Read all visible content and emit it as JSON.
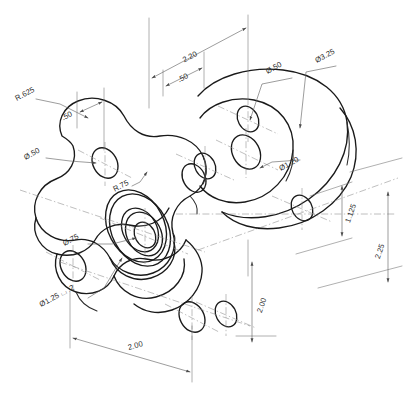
{
  "drawing": {
    "title": "Isometric Engineering Drawing — Four-Lobe Flange Plate with Mating Disc Flange",
    "background_color": "#ffffff",
    "line_color": "#1a1a1a",
    "dimension_color": "#5a5a5a",
    "center_line_color": "#8a8a8a",
    "projection": "isometric",
    "units": "inches",
    "part_description": "Four-lobed cloverleaf plate with central counterbored boss, mated to a round bolt-circle flange disc",
    "dimensions": [
      {
        "id": "dim-2-20",
        "label": "2.20",
        "type": "linear",
        "x": 191,
        "y": 59,
        "rotate": -28
      },
      {
        "id": "dim-50-top",
        "label": ".50",
        "type": "linear",
        "x": 182,
        "y": 82,
        "rotate": -28
      },
      {
        "id": "dim-diam-50-top",
        "label": "Ø.50",
        "type": "diameter",
        "x": 272,
        "y": 66,
        "rotate": -28
      },
      {
        "id": "dim-diam-3-25",
        "label": "Ø3.25",
        "type": "diameter",
        "x": 322,
        "y": 58,
        "rotate": -28
      },
      {
        "id": "dim-r-625",
        "label": "R.625",
        "type": "radius",
        "x": 22,
        "y": 100,
        "rotate": -28
      },
      {
        "id": "dim-50-left",
        "label": ".50",
        "type": "linear",
        "x": 66,
        "y": 117,
        "rotate": -28
      },
      {
        "id": "dim-diam-50-left",
        "label": "Ø.50",
        "type": "diameter",
        "x": 30,
        "y": 157,
        "rotate": -28
      },
      {
        "id": "dim-r-75",
        "label": "R.75",
        "type": "radius",
        "x": 120,
        "y": 185,
        "rotate": -28
      },
      {
        "id": "dim-diam-1-20",
        "label": "Ø1.20",
        "type": "diameter",
        "x": 283,
        "y": 166,
        "rotate": -28
      },
      {
        "id": "dim-diam-75",
        "label": "Ø.75",
        "type": "diameter",
        "x": 64,
        "y": 242,
        "rotate": -28
      },
      {
        "id": "dim-cbore",
        "label": "Ø1.25 ⌴ .2",
        "type": "counterbore",
        "x": 47,
        "y": 298,
        "rotate": -28
      },
      {
        "id": "dim-1-125",
        "label": "1.125",
        "type": "linear",
        "x": 363,
        "y": 216,
        "rotate": 62
      },
      {
        "id": "dim-2-25",
        "label": "2.25",
        "type": "linear",
        "x": 392,
        "y": 250,
        "rotate": 62
      },
      {
        "id": "dim-2-00-right",
        "label": "2.00",
        "type": "linear",
        "x": 263,
        "y": 307,
        "rotate": 62
      },
      {
        "id": "dim-2-00-bottom",
        "label": "2.00",
        "type": "linear",
        "x": 145,
        "y": 352,
        "rotate": -28
      }
    ],
    "features": [
      {
        "name": "four-lobe-plate",
        "note": "Cloverleaf plate body, 4 lobes with R.625 outer radii and R.75 fillets"
      },
      {
        "name": "center-counterbore",
        "note": "Central Ø.75 through hole with Ø1.25 counterbore, .2 deep"
      },
      {
        "name": "lobe-holes",
        "note": "Four Ø.50 holes, one at each lobe"
      },
      {
        "name": "disc-flange",
        "note": "Ø3.25 round flange with Ø1.20 central bore and Ø.50 bolt holes"
      },
      {
        "name": "plate-thickness",
        "note": ".50 material thickness"
      }
    ]
  }
}
